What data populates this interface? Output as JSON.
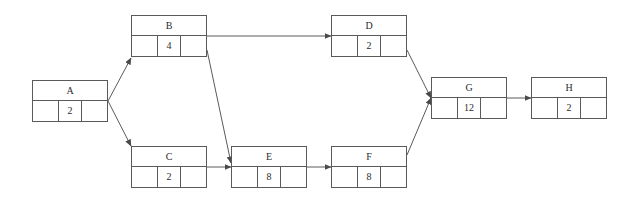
{
  "diagram": {
    "type": "activity-on-node-network",
    "background_color": "#ffffff",
    "line_color": "#5a5a5a",
    "text_color": "#2b2b2b",
    "nodes": [
      {
        "id": "A",
        "label": "A",
        "duration": "2",
        "left_cell": "",
        "right_cell": "",
        "x": 32,
        "y": 80,
        "w": 76,
        "h": 42
      },
      {
        "id": "B",
        "label": "B",
        "duration": "4",
        "left_cell": "",
        "right_cell": "",
        "x": 131,
        "y": 15,
        "w": 76,
        "h": 42
      },
      {
        "id": "C",
        "label": "C",
        "duration": "2",
        "left_cell": "",
        "right_cell": "",
        "x": 131,
        "y": 146,
        "w": 76,
        "h": 42
      },
      {
        "id": "D",
        "label": "D",
        "duration": "2",
        "left_cell": "",
        "right_cell": "",
        "x": 331,
        "y": 15,
        "w": 76,
        "h": 42
      },
      {
        "id": "E",
        "label": "E",
        "duration": "8",
        "left_cell": "",
        "right_cell": "",
        "x": 231,
        "y": 146,
        "w": 76,
        "h": 42
      },
      {
        "id": "F",
        "label": "F",
        "duration": "8",
        "left_cell": "",
        "right_cell": "",
        "x": 331,
        "y": 146,
        "w": 76,
        "h": 42
      },
      {
        "id": "G",
        "label": "G",
        "duration": "12",
        "left_cell": "",
        "right_cell": "",
        "x": 431,
        "y": 77,
        "w": 76,
        "h": 42
      },
      {
        "id": "H",
        "label": "H",
        "duration": "2",
        "left_cell": "",
        "right_cell": "",
        "x": 531,
        "y": 77,
        "w": 76,
        "h": 42
      }
    ],
    "edges": [
      {
        "from": "A",
        "to": "B",
        "x1": 108,
        "y1": 101,
        "x2": 131,
        "y2": 58
      },
      {
        "from": "A",
        "to": "C",
        "x1": 108,
        "y1": 101,
        "x2": 131,
        "y2": 146
      },
      {
        "from": "B",
        "to": "D",
        "x1": 207,
        "y1": 36,
        "x2": 331,
        "y2": 36
      },
      {
        "from": "B",
        "to": "E",
        "x1": 207,
        "y1": 50,
        "x2": 231,
        "y2": 163
      },
      {
        "from": "C",
        "to": "E",
        "x1": 207,
        "y1": 167,
        "x2": 231,
        "y2": 167
      },
      {
        "from": "E",
        "to": "F",
        "x1": 307,
        "y1": 167,
        "x2": 331,
        "y2": 167
      },
      {
        "from": "D",
        "to": "G",
        "x1": 407,
        "y1": 50,
        "x2": 431,
        "y2": 98
      },
      {
        "from": "F",
        "to": "G",
        "x1": 407,
        "y1": 155,
        "x2": 431,
        "y2": 98
      },
      {
        "from": "G",
        "to": "H",
        "x1": 507,
        "y1": 98,
        "x2": 531,
        "y2": 98
      }
    ]
  }
}
